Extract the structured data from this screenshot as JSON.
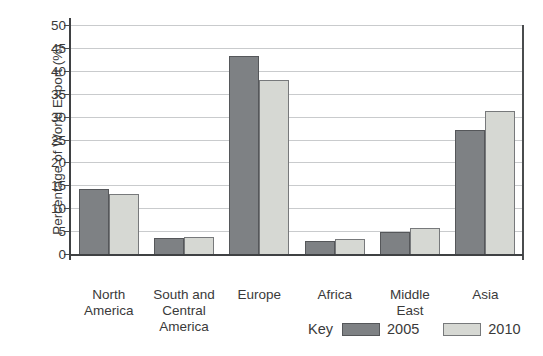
{
  "chart_data": {
    "type": "bar",
    "title": "",
    "xlabel": "",
    "ylabel": "Percentage of World Export (%)",
    "ylim": [
      0,
      50
    ],
    "ytick_step": 5,
    "yticks": [
      0,
      5,
      10,
      15,
      20,
      25,
      30,
      35,
      40,
      45,
      50
    ],
    "grid": true,
    "categories": [
      "North America",
      "South and Central America",
      "Europe",
      "Africa",
      "Middle East",
      "Asia"
    ],
    "category_label_lines": [
      [
        "North",
        "America"
      ],
      [
        "South and",
        "Central",
        "America"
      ],
      [
        "Europe"
      ],
      [
        "Africa"
      ],
      [
        "Middle",
        "East"
      ],
      [
        "Asia"
      ]
    ],
    "series": [
      {
        "name": "2005",
        "values": [
          14.3,
          3.4,
          43.2,
          2.9,
          4.9,
          27.1
        ]
      },
      {
        "name": "2010",
        "values": [
          13.0,
          3.8,
          37.9,
          3.2,
          5.6,
          31.2
        ]
      }
    ],
    "legend": {
      "title": "Key",
      "entries": [
        "2005",
        "2010"
      ],
      "position": "bottom-right"
    }
  },
  "colors": {
    "bar_2005_fill": "#7e8184",
    "bar_2005_border": "#55575a",
    "bar_2010_fill": "#d6d8d3",
    "bar_2010_border": "#77797b",
    "gridline": "#c9cbcd",
    "axis": "#3f4143",
    "text": "#3a3a3a",
    "background": "#ffffff"
  }
}
